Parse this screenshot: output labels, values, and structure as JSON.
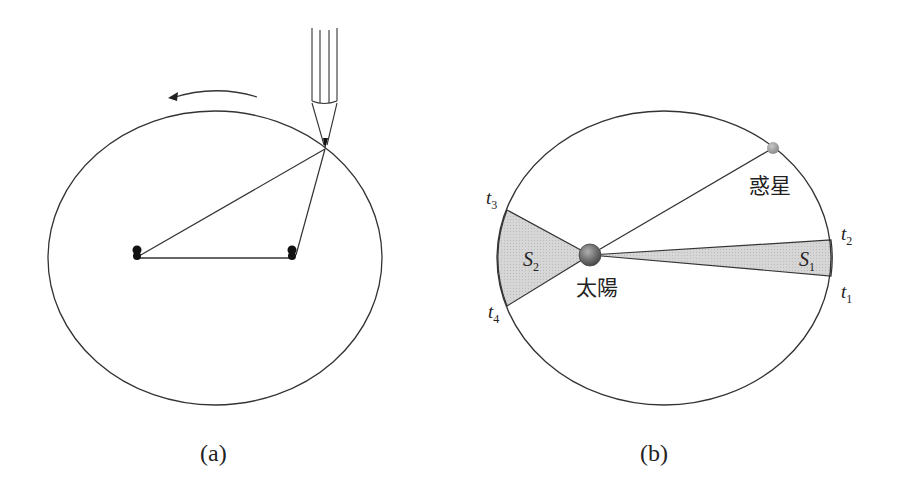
{
  "figure": {
    "panels": [
      {
        "id": "a",
        "caption": "(a)",
        "description": "Drawing an ellipse with a string fixed at two pins and a pencil",
        "rotation_arrow": "counterclockwise"
      },
      {
        "id": "b",
        "caption": "(b)",
        "labels": {
          "sun": "太陽",
          "planet": "惑星",
          "t1": "t",
          "t1_sub": "1",
          "t2": "t",
          "t2_sub": "2",
          "t3": "t",
          "t3_sub": "3",
          "t4": "t",
          "t4_sub": "4",
          "s1": "S",
          "s1_sub": "1",
          "s2": "S",
          "s2_sub": "2"
        }
      }
    ],
    "colors": {
      "stroke": "#333333",
      "sector_fill": "#d4d4d4",
      "sun": "#6e6e6e",
      "planet": "#9a9a9a"
    }
  }
}
